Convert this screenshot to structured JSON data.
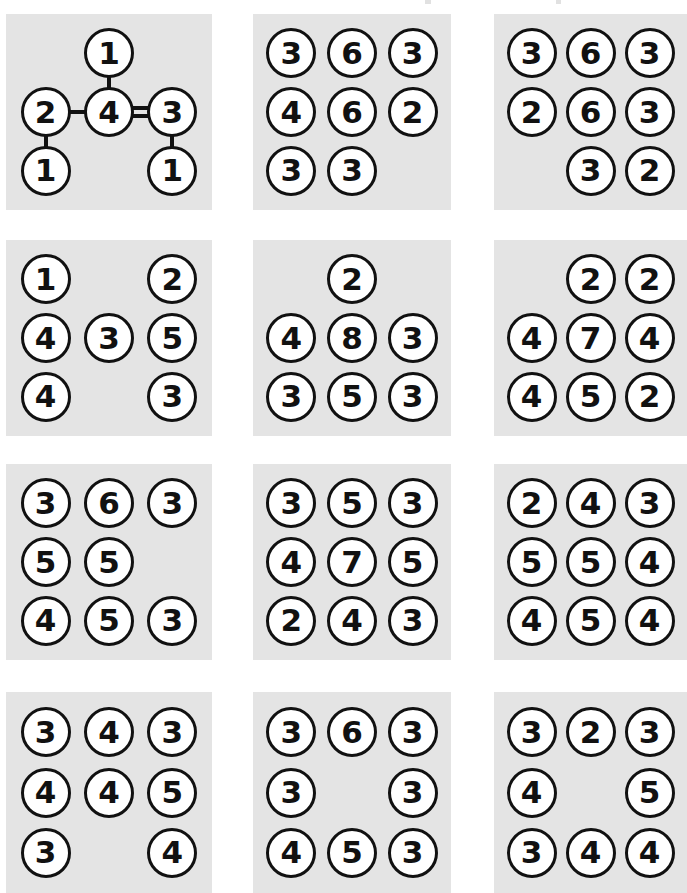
{
  "figure": {
    "title": "",
    "background_color": "#ffffff",
    "panel_background_color": "#e4e4e4",
    "node_fill_color": "#ffffff",
    "node_stroke_color": "#111111",
    "panel_count": 12,
    "grid_columns": 3,
    "grid_rows": 4
  },
  "chart_data": {
    "type": "diagram",
    "title": "",
    "node_value_range": [
      1,
      8
    ],
    "panels": [
      {
        "index": 1,
        "row": 1,
        "col": 1,
        "has_edges": true,
        "cells": [
          [
            null,
            "1",
            null
          ],
          [
            "2",
            "4",
            "3"
          ],
          [
            "1",
            null,
            "1"
          ]
        ],
        "edges": [
          {
            "from": [
              1,
              1
            ],
            "to": [
              0,
              1
            ],
            "order": 1
          },
          {
            "from": [
              1,
              1
            ],
            "to": [
              1,
              0
            ],
            "order": 1
          },
          {
            "from": [
              1,
              1
            ],
            "to": [
              1,
              2
            ],
            "order": 2
          },
          {
            "from": [
              1,
              0
            ],
            "to": [
              2,
              0
            ],
            "order": 1
          },
          {
            "from": [
              1,
              2
            ],
            "to": [
              2,
              2
            ],
            "order": 1
          }
        ]
      },
      {
        "index": 2,
        "row": 1,
        "col": 2,
        "has_edges": false,
        "cells": [
          [
            "3",
            "6",
            "3"
          ],
          [
            "4",
            "6",
            "2"
          ],
          [
            "3",
            "3",
            null
          ]
        ]
      },
      {
        "index": 3,
        "row": 1,
        "col": 3,
        "has_edges": false,
        "cells": [
          [
            "3",
            "6",
            "3"
          ],
          [
            "2",
            "6",
            "3"
          ],
          [
            null,
            "3",
            "2"
          ]
        ]
      },
      {
        "index": 4,
        "row": 2,
        "col": 1,
        "has_edges": false,
        "cells": [
          [
            "1",
            null,
            "2"
          ],
          [
            "4",
            "3",
            "5"
          ],
          [
            "4",
            null,
            "3"
          ]
        ]
      },
      {
        "index": 5,
        "row": 2,
        "col": 2,
        "has_edges": false,
        "cells": [
          [
            null,
            "2",
            null
          ],
          [
            "4",
            "8",
            "3"
          ],
          [
            "3",
            "5",
            "3"
          ]
        ]
      },
      {
        "index": 6,
        "row": 2,
        "col": 3,
        "has_edges": false,
        "cells": [
          [
            null,
            "2",
            "2"
          ],
          [
            "4",
            "7",
            "4"
          ],
          [
            "4",
            "5",
            "2"
          ]
        ]
      },
      {
        "index": 7,
        "row": 3,
        "col": 1,
        "has_edges": false,
        "cells": [
          [
            "3",
            "6",
            "3"
          ],
          [
            "5",
            "5",
            null
          ],
          [
            "4",
            "5",
            "3"
          ]
        ]
      },
      {
        "index": 8,
        "row": 3,
        "col": 2,
        "has_edges": false,
        "cells": [
          [
            "3",
            "5",
            "3"
          ],
          [
            "4",
            "7",
            "5"
          ],
          [
            "2",
            "4",
            "3"
          ]
        ]
      },
      {
        "index": 9,
        "row": 3,
        "col": 3,
        "has_edges": false,
        "cells": [
          [
            "2",
            "4",
            "3"
          ],
          [
            "5",
            "5",
            "4"
          ],
          [
            "4",
            "5",
            "4"
          ]
        ]
      },
      {
        "index": 10,
        "row": 4,
        "col": 1,
        "has_edges": false,
        "cells": [
          [
            "3",
            "4",
            "3"
          ],
          [
            "4",
            "4",
            "5"
          ],
          [
            "3",
            null,
            "4"
          ]
        ]
      },
      {
        "index": 11,
        "row": 4,
        "col": 2,
        "has_edges": false,
        "cells": [
          [
            "3",
            "6",
            "3"
          ],
          [
            "3",
            null,
            "3"
          ],
          [
            "4",
            "5",
            "3"
          ]
        ]
      },
      {
        "index": 12,
        "row": 4,
        "col": 3,
        "has_edges": false,
        "cells": [
          [
            "3",
            "2",
            "3"
          ],
          [
            "4",
            null,
            "5"
          ],
          [
            "3",
            "4",
            "4"
          ]
        ]
      }
    ]
  },
  "layout": {
    "panel_boxes": [
      {
        "x": 6,
        "y": 14,
        "w": 206,
        "h": 196
      },
      {
        "x": 253,
        "y": 14,
        "w": 198,
        "h": 196
      },
      {
        "x": 494,
        "y": 14,
        "w": 193,
        "h": 196
      },
      {
        "x": 6,
        "y": 240,
        "w": 206,
        "h": 196
      },
      {
        "x": 253,
        "y": 240,
        "w": 198,
        "h": 196
      },
      {
        "x": 494,
        "y": 240,
        "w": 193,
        "h": 196
      },
      {
        "x": 6,
        "y": 464,
        "w": 206,
        "h": 196
      },
      {
        "x": 253,
        "y": 464,
        "w": 198,
        "h": 196
      },
      {
        "x": 494,
        "y": 464,
        "w": 193,
        "h": 196
      },
      {
        "x": 6,
        "y": 692,
        "w": 206,
        "h": 201
      },
      {
        "x": 253,
        "y": 692,
        "w": 198,
        "h": 201
      },
      {
        "x": 494,
        "y": 692,
        "w": 193,
        "h": 201
      }
    ],
    "node_diameter": 50,
    "node_font_size": 31
  }
}
